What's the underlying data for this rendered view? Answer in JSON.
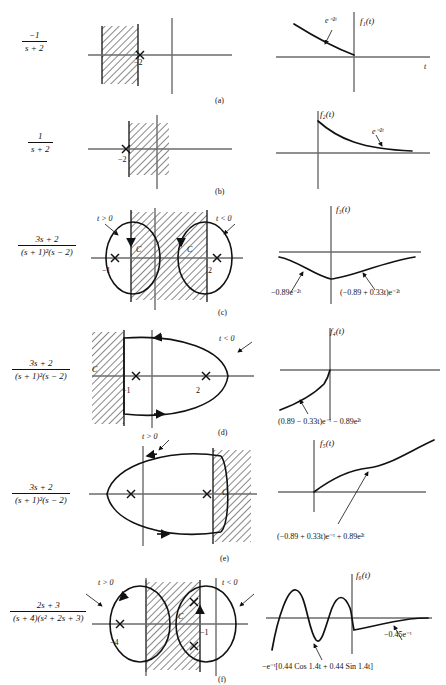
{
  "figure": {
    "caption_visible": false,
    "panels": [
      {
        "id": "a",
        "caption": "(a)",
        "transfer_numerator": "−1",
        "transfer_denominator": "s + 2",
        "pole_label": "−2",
        "time_label": "f₁(t)",
        "axis_label": "t",
        "curve_label": "e⁻²ᵗ",
        "roc_side": "left"
      },
      {
        "id": "b",
        "caption": "(b)",
        "transfer_numerator": "1",
        "transfer_denominator": "s + 2",
        "pole_label": "−2",
        "time_label": "f₂(t)",
        "axis_label": "",
        "curve_label": "e⁻²ᵗ",
        "roc_side": "right"
      },
      {
        "id": "c",
        "caption": "(c)",
        "transfer_numerator": "3s + 2",
        "transfer_denominator": "(s + 1)²(s − 2)",
        "pole_labels": [
          "−1",
          "2"
        ],
        "contour_labels": [
          "t > 0",
          "t < 0"
        ],
        "contour_name": "C",
        "time_label": "f₃(t)",
        "annotations": [
          "−0.89e⁻²ᵗ",
          "(−0.89 + 0.33t)e⁻²ᵗ"
        ]
      },
      {
        "id": "d",
        "caption": "(d)",
        "transfer_numerator": "3s + 2",
        "transfer_denominator": "(s + 1)²(s − 2)",
        "pole_labels": [
          "−1",
          "2"
        ],
        "contour_labels": [
          "t < 0"
        ],
        "contour_name": "C",
        "time_label": "f₄(t)",
        "annotations": [
          "(0.89 − 0.33t)e⁻ᵗ − 0.89e²ᵗ"
        ]
      },
      {
        "id": "e",
        "caption": "(e)",
        "transfer_numerator": "3s + 2",
        "transfer_denominator": "(s + 1)²(s − 2)",
        "pole_labels": [
          "",
          ""
        ],
        "contour_labels": [
          "t > 0"
        ],
        "contour_name": "C",
        "time_label": "f₅(t)",
        "annotations": [
          "(−0.89 + 0.33t)e⁻ᵗ + 0.89e²ᵗ"
        ]
      },
      {
        "id": "f",
        "caption": "(f)",
        "transfer_numerator": "2s + 3",
        "transfer_denominator": "(s + 4)(s² + 2s + 3)",
        "pole_labels": [
          "−4",
          "−1"
        ],
        "contour_labels": [
          "t > 0",
          "t < 0"
        ],
        "contour_name": "C",
        "time_label": "f₆(t)",
        "annotations": [
          "−e⁻ᵗ[0.44 Cos 1.4t + 0.44 Sin 1.4t]",
          "−0.45e⁻ᵗ"
        ]
      }
    ]
  },
  "colors": {
    "ink": "#111111",
    "axis": "#6b6b6b",
    "page": "#ffffff"
  }
}
